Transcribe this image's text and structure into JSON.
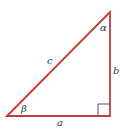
{
  "diagram": {
    "type": "right-triangle",
    "stroke_color": "#c8393a",
    "right_angle_marker_color": "#555555",
    "label_color": "#3a3a3a",
    "sides": {
      "hypotenuse": "c",
      "vertical": "b",
      "horizontal": "a"
    },
    "angles": {
      "top": "α",
      "bottom_left": "β"
    }
  }
}
